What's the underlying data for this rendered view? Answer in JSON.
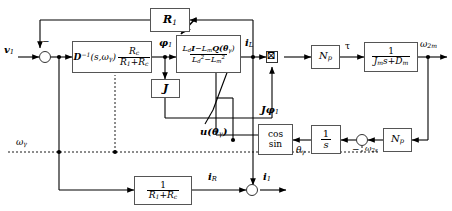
{
  "figure": {
    "type": "control-block-diagram",
    "background": "#ffffff",
    "line_color": "#000000",
    "block_border_color": "#555555"
  },
  "signals": {
    "input_v1": "v",
    "input_v1_sub": "1",
    "phi1": "φ",
    "phi1_sub": "1",
    "iL": "i",
    "iL_sub": "L",
    "tau": "τ",
    "omega2m": "ω",
    "omega2m_sub": "2m",
    "omega2s": "ω",
    "omega2s_sub": "2s",
    "omega_gamma": "ω",
    "omega_gamma_sub": "γ",
    "theta_gamma": "θ",
    "theta_gamma_sub": "γ",
    "iR": "i",
    "iR_sub": "R",
    "i1": "i",
    "i1_sub": "1",
    "Jphi1": "Jφ",
    "Jphi1_sub": "1",
    "u_theta": "u(θ",
    "u_theta_sub": "γ",
    "u_theta_close": ")"
  },
  "blocks": {
    "r1_feedback": {
      "name": "R1 feedback gain",
      "label_main": "R",
      "label_sub": "1"
    },
    "dinv": {
      "name": "Inverse impedance block",
      "part1": "D",
      "part1_sup": "−1",
      "part2": "(s,ω",
      "part2_sub": "γ",
      "part2_close": ")",
      "frac_num": "R",
      "frac_num_sub": "c",
      "frac_den_a": "R",
      "frac_den_a_sub": "1",
      "frac_den_plus": "+R",
      "frac_den_b_sub": "c"
    },
    "inductance": {
      "name": "Inductance matrix block",
      "num_a": "L",
      "num_a_sub": "d",
      "num_I": "I",
      "num_minus": "−",
      "num_b": "L",
      "num_b_sub": "m",
      "num_Q": "Q(θ",
      "num_Q_sub": "γ",
      "num_Q_close": ")",
      "den_a": "L",
      "den_a_sub": "d",
      "den_a_sup": "2",
      "den_minus": "−",
      "den_b": "L",
      "den_b_sub": "m",
      "den_b_sup": "2"
    },
    "j_matrix": {
      "name": "J rotation matrix",
      "label": "J"
    },
    "np_top": {
      "name": "Pole pair gain (torque path)",
      "label_main": "N",
      "label_sub": "p"
    },
    "mech": {
      "name": "Mechanical transfer function",
      "num": "1",
      "den_a": "J",
      "den_a_sub": "m",
      "den_s": "s",
      "den_plus": "+D",
      "den_b_sub": "m"
    },
    "cossin": {
      "name": "cos sin lookup block",
      "line1": "cos",
      "line2": "sin"
    },
    "integrator": {
      "name": "Integrator",
      "num": "1",
      "den": "s"
    },
    "np_bottom": {
      "name": "Pole pair gain (speed path)",
      "label_main": "N",
      "label_sub": "p"
    },
    "resistance": {
      "name": "Resistive branch gain",
      "num": "1",
      "den_a": "R",
      "den_a_sub": "1",
      "den_plus": "+R",
      "den_b_sub": "c"
    }
  },
  "junctions": {
    "input_sum": {
      "name": "input summing junction",
      "sign": "−"
    },
    "speed_sum": {
      "name": "speed summing junction",
      "sign": "−"
    },
    "current_sum": {
      "name": "current summing junction",
      "sign": ""
    },
    "torque_mult": {
      "name": "torque multiplier",
      "symbol": "⊠"
    }
  }
}
